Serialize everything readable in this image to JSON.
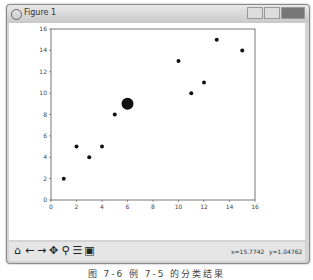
{
  "window": {
    "title": "Figure 1"
  },
  "toolbar": {
    "icons": [
      "home-icon",
      "back-icon",
      "forward-icon",
      "pan-icon",
      "zoom-icon",
      "configure-icon",
      "save-icon"
    ],
    "glyphs": [
      "⌂",
      "←",
      "→",
      "✥",
      "⚲",
      "☰",
      "▣"
    ],
    "coord_x": "x=15.7742",
    "coord_y": "y=1.04762"
  },
  "caption": "图 7-6  例 7-5 的分类结果",
  "chart_data": {
    "type": "scatter",
    "title": "",
    "xlabel": "",
    "ylabel": "",
    "xlim": [
      0,
      16
    ],
    "ylim": [
      0,
      16
    ],
    "xticks": [
      0,
      2,
      4,
      6,
      8,
      10,
      12,
      14,
      16
    ],
    "yticks": [
      0,
      2,
      4,
      6,
      8,
      10,
      12,
      14,
      16
    ],
    "grid": false,
    "series": [
      {
        "name": "points",
        "x": [
          1,
          2,
          3,
          4,
          5,
          10,
          11,
          12,
          13,
          15
        ],
        "y": [
          2,
          5,
          4,
          5,
          8,
          13,
          10,
          11,
          15,
          14
        ],
        "size": "small"
      },
      {
        "name": "center",
        "x": [
          6
        ],
        "y": [
          9
        ],
        "size": "large"
      }
    ]
  }
}
